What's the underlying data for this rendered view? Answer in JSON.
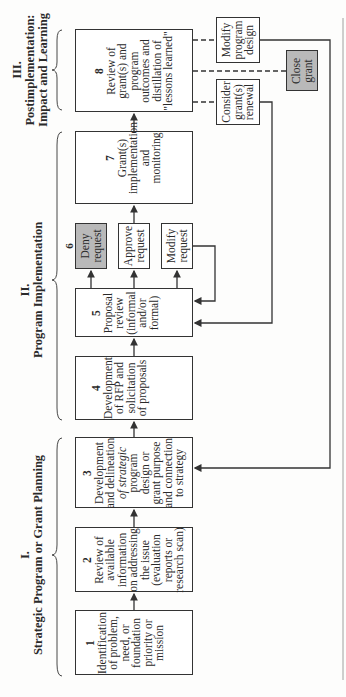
{
  "sections": [
    {
      "numeral": "I.",
      "title": "Strategic Program or Grant Planning"
    },
    {
      "numeral": "II.",
      "title": "Program Implementation"
    },
    {
      "numeral": "III.",
      "title": "Postimplementation:",
      "title2": "Impact and Learning"
    }
  ],
  "steps": [
    {
      "num": "1",
      "lines": [
        "Identification",
        "of problem,",
        "need, or",
        "foundation",
        "priority or",
        "mission"
      ]
    },
    {
      "num": "2",
      "lines": [
        "Review of",
        "available",
        "information",
        "on addressing",
        "the issue",
        "(evaluation",
        "reports or",
        "research scan)"
      ]
    },
    {
      "num": "3",
      "lines": [
        "Development",
        "and delineation",
        "of strategic",
        "program",
        "design or",
        "grant purpose",
        "and connection",
        "to strategy"
      ]
    },
    {
      "num": "4",
      "lines": [
        "Development",
        "of RFP and",
        "solicitation",
        "of proposals"
      ]
    },
    {
      "num": "5",
      "lines": [
        "Proposal",
        "review",
        "(informal",
        "and/or",
        "formal)"
      ]
    },
    {
      "num": "6",
      "options": [
        {
          "lines": [
            "Deny",
            "request"
          ],
          "shaded": true
        },
        {
          "lines": [
            "Approve",
            "request"
          ],
          "shaded": false
        },
        {
          "lines": [
            "Modify",
            "request"
          ],
          "shaded": false
        }
      ]
    },
    {
      "num": "7",
      "lines": [
        "Grant(s)",
        "implementation",
        "and",
        "monitoring"
      ]
    },
    {
      "num": "8",
      "lines": [
        "Review of",
        "grant(s) and",
        "program",
        "outcomes and",
        "distillation of",
        "\"lessons learned\""
      ]
    }
  ],
  "outcomes": [
    {
      "lines": [
        "Modify",
        "program",
        "design"
      ],
      "shaded": false
    },
    {
      "lines": [
        "Close",
        "grant"
      ],
      "shaded": true
    },
    {
      "lines": [
        "Consider",
        "grant(s)",
        "renewal"
      ],
      "shaded": false
    }
  ],
  "colors": {
    "shaded": "#b9b9b9",
    "line": "#333333"
  }
}
